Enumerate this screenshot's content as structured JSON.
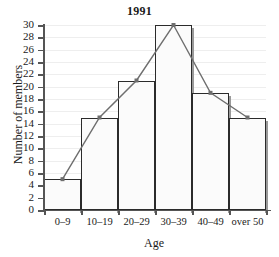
{
  "chart_data": {
    "type": "bar",
    "title": "1991",
    "xlabel": "Age",
    "ylabel": "Number of members",
    "categories": [
      "0–9",
      "10–19",
      "20–29",
      "30–39",
      "40–49",
      "over 50"
    ],
    "values": [
      5,
      15,
      21,
      30,
      19,
      15
    ],
    "series": [
      {
        "name": "Number of members (histogram)",
        "values": [
          5,
          15,
          21,
          30,
          19,
          15
        ]
      },
      {
        "name": "Frequency polygon",
        "values": [
          5,
          15,
          21,
          30,
          19,
          15
        ]
      }
    ],
    "ylim": [
      0,
      30
    ],
    "ytick_step": 2,
    "ytick_labels": [
      "0",
      "2",
      "4",
      "6",
      "8",
      "10",
      "12",
      "14",
      "16",
      "18",
      "20",
      "22",
      "24",
      "26",
      "28",
      "30"
    ],
    "grid": true,
    "legend": "none",
    "overlay": "frequency-polygon-with-markers",
    "colors": {
      "bar_fill": "#fbfbfb",
      "bar_border": "#2b2b2b",
      "bar_shadow": "#9a9a9a",
      "line": "#6e6e6e",
      "marker": "#6e6e6e",
      "axis": "#555555",
      "gridline": "#eeeeee",
      "text": "#1a1a1a"
    }
  },
  "icons": {
    "data_point_marker": "square-marker-icon"
  }
}
